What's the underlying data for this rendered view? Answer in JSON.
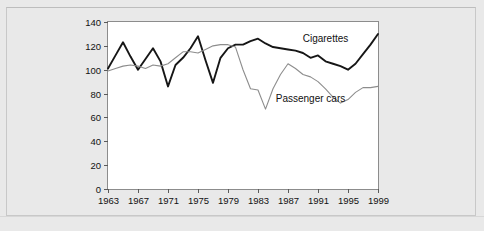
{
  "figure": {
    "background_color": "#e9e9e9",
    "plot_background_color": "#ffffff",
    "frame_color": "#8c8c8c"
  },
  "chart_data": {
    "type": "line",
    "title": "",
    "subtitle": "",
    "xlabel": "",
    "ylabel": "",
    "xlim": [
      1963,
      1999
    ],
    "ylim": [
      0,
      140
    ],
    "grid": false,
    "legend_position": "inline-annotation",
    "y_ticks": [
      0,
      20,
      40,
      60,
      80,
      100,
      120,
      140
    ],
    "y_tick_labels": [
      "0",
      "20",
      "40",
      "60",
      "80",
      "100",
      "120",
      "140"
    ],
    "x_ticks": [
      1963,
      1967,
      1971,
      1975,
      1979,
      1983,
      1987,
      1991,
      1995,
      1999
    ],
    "x_tick_labels": [
      "1963",
      "1967",
      "1971",
      "1975",
      "1979",
      "1983",
      "1987",
      "1991",
      "1995",
      "1999"
    ],
    "x": [
      1963,
      1964,
      1965,
      1966,
      1967,
      1968,
      1969,
      1970,
      1971,
      1972,
      1973,
      1974,
      1975,
      1976,
      1977,
      1978,
      1979,
      1980,
      1981,
      1982,
      1983,
      1984,
      1985,
      1986,
      1987,
      1988,
      1989,
      1990,
      1991,
      1992,
      1993,
      1994,
      1995,
      1996,
      1997,
      1998,
      1999
    ],
    "series": [
      {
        "name": "Cigarettes",
        "color": "#161616",
        "line_width": 1.9,
        "label_x": 1992,
        "label_y": 123,
        "values": [
          101,
          112,
          123,
          111,
          100,
          109,
          118,
          107,
          86,
          104,
          110,
          118,
          128,
          108,
          89,
          110,
          118,
          121,
          121,
          124,
          126,
          122,
          119,
          118,
          117,
          116,
          114,
          110,
          112,
          107,
          105,
          103,
          100,
          105,
          113,
          121,
          130
        ]
      },
      {
        "name": "Passenger cars",
        "color": "#8d8d8d",
        "line_width": 1.1,
        "label_x": 1990,
        "label_y": 73,
        "values": [
          99,
          101,
          103,
          104,
          103,
          101,
          104,
          103,
          105,
          110,
          115,
          115,
          114,
          117,
          120,
          121,
          121,
          119,
          100,
          84,
          83,
          67,
          84,
          96,
          105,
          101,
          96,
          94,
          90,
          84,
          77,
          72,
          75,
          81,
          85,
          85,
          86
        ]
      }
    ]
  }
}
